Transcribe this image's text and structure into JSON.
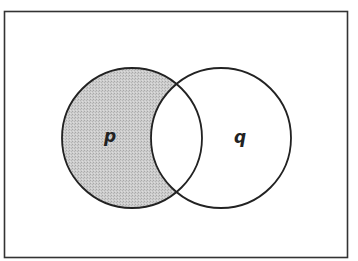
{
  "diagram": {
    "type": "venn",
    "universe": {
      "x": 4,
      "y": 11,
      "width": 344,
      "height": 247,
      "stroke": "#333333"
    },
    "sets": [
      {
        "id": "p",
        "label": "p",
        "cx": 132,
        "cy": 138,
        "r": 70,
        "label_x": 109,
        "label_y": 136
      },
      {
        "id": "q",
        "label": "q",
        "cx": 221,
        "cy": 138,
        "r": 70,
        "label_x": 240,
        "label_y": 136
      }
    ],
    "shaded_region": "p minus q",
    "colors": {
      "shade": "#c4c4c4",
      "stroke": "#222222",
      "background": "#ffffff"
    }
  }
}
